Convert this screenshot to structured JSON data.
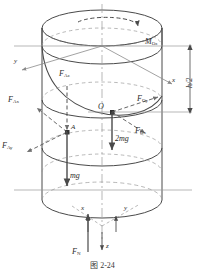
{
  "figure": {
    "caption": "图 2-24",
    "body_label_O": "O",
    "body_label_A": "A"
  },
  "dimension": {
    "height_label": "h/2"
  },
  "axes": [
    {
      "name": "y-axis-upper-left",
      "label": "y"
    },
    {
      "name": "x-axis-upper-right",
      "label": "x"
    },
    {
      "name": "x-axis-base",
      "label": "x"
    },
    {
      "name": "y-axis-base",
      "label": "y"
    },
    {
      "name": "z-axis-base",
      "label": "z"
    }
  ],
  "forces": [
    {
      "name": "F_Az",
      "base": "F",
      "sub": "Az"
    },
    {
      "name": "F_Ax",
      "base": "F",
      "sub": "Ax"
    },
    {
      "name": "F_Ay",
      "base": "F",
      "sub": "Ay"
    },
    {
      "name": "F_Oy",
      "base": "F",
      "sub": "Oy"
    },
    {
      "name": "F_Ox",
      "base": "F",
      "sub": "Ox"
    },
    {
      "name": "F_N",
      "base": "F",
      "sub": "N"
    }
  ],
  "moments": [
    {
      "name": "M_Oz",
      "base": "M",
      "sub": "Oz"
    }
  ],
  "weights": [
    {
      "name": "mg-weight",
      "text": "mg"
    },
    {
      "name": "2mg-weight",
      "text": "2mg"
    }
  ],
  "colors": {
    "outline": "#4a4a4a",
    "dashed": "#7d7d7d",
    "axis": "#8a8a8a",
    "text": "#2b2b2b"
  }
}
